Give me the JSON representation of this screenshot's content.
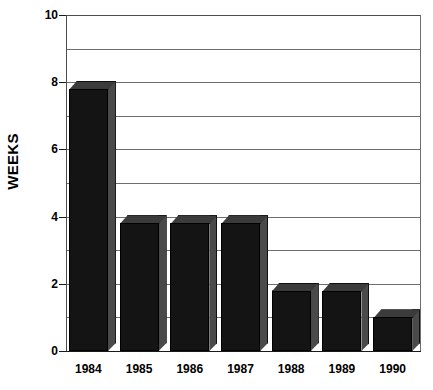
{
  "chart_data": {
    "type": "bar",
    "title": "",
    "subtitle": "",
    "xlabel": "",
    "ylabel": "WEEKS",
    "categories": [
      "1984",
      "1985",
      "1986",
      "1987",
      "1988",
      "1989",
      "1990"
    ],
    "values": [
      7.8,
      3.8,
      3.8,
      3.8,
      1.8,
      1.8,
      1.0
    ],
    "series": [
      {
        "name": "WEEKS",
        "values": [
          7.8,
          3.8,
          3.8,
          3.8,
          1.8,
          1.8,
          1.0
        ]
      }
    ],
    "ylim": [
      0,
      10
    ],
    "xlim": [
      0,
      7
    ],
    "y_major_ticks": [
      0,
      2,
      4,
      6,
      8,
      10
    ],
    "y_tick_labels": [
      "0",
      "2",
      "4",
      "6",
      "8",
      "10"
    ],
    "y_gridlines": [
      1,
      2,
      3,
      4,
      5,
      6,
      7,
      8,
      9,
      10
    ],
    "grid": true,
    "grid_axis": "y",
    "legend": false,
    "legend_position": "none",
    "style": "3d-column",
    "bar_color": "#141414",
    "bar_side_color": "#4a4a4a",
    "bar_top_color": "#3b3b3b",
    "grid_color": "#6e6e6e",
    "axis_color": "#1a1a1a",
    "background": "#ffffff"
  },
  "axis": {
    "y_title": "WEEKS"
  }
}
